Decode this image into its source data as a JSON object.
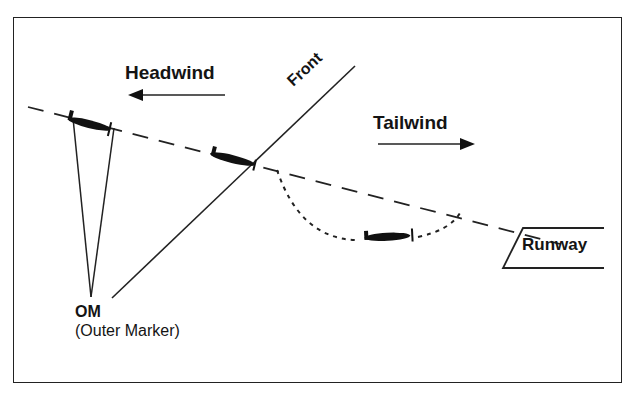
{
  "diagram": {
    "labels": {
      "headwind": "Headwind",
      "tailwind": "Tailwind",
      "front": "Front",
      "runway": "Runway",
      "om": "OM",
      "outer_marker": "(Outer Marker)"
    },
    "elements": {
      "glide_path": "dashed line descending left to right toward runway",
      "front_line": "solid diagonal line from OM area rising to upper right",
      "flight_path_deviation": "dotted curve below glide path after crossing front",
      "aircraft": [
        "aircraft over outer marker",
        "aircraft at front",
        "aircraft below glide path"
      ],
      "arrows": [
        {
          "label": "Headwind",
          "direction": "left"
        },
        {
          "label": "Tailwind",
          "direction": "right"
        }
      ]
    },
    "colors": {
      "ink": "#141414",
      "background": "#ffffff"
    }
  }
}
